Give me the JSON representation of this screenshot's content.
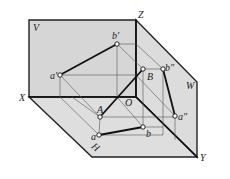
{
  "diagram": {
    "colors": {
      "plane_fill": "#d9d9d9",
      "frame": "#222222",
      "thin_line": "#555555",
      "point_fill": "#ffffff"
    },
    "plane_labels": {
      "V": "V",
      "W": "W",
      "H": "H"
    },
    "axis_labels": {
      "X": "X",
      "Y": "Y",
      "Z": "Z",
      "O": "O"
    },
    "points": {
      "a_prime": "a'",
      "b_prime": "b'",
      "A": "A",
      "B": "B",
      "b_double_prime": "b\"",
      "a_double_prime": "a\"",
      "a": "a",
      "b": "b"
    }
  }
}
